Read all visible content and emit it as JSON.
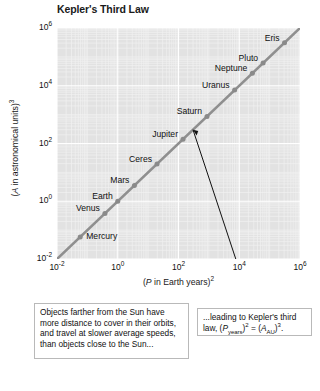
{
  "chart_data": {
    "type": "scatter",
    "title": "Kepler's Third Law",
    "xlabel": "(P in Earth years)²",
    "ylabel": "(A in astronomical units)³",
    "xlabel_parts": {
      "prefix": "(",
      "italic": "P",
      "mid": " in Earth years)",
      "exp": "2"
    },
    "ylabel_parts": {
      "prefix": "(",
      "italic": "A",
      "mid": " in astronomical units)",
      "exp": "3"
    },
    "xscale": "log",
    "yscale": "log",
    "xlim": [
      0.01,
      1000000
    ],
    "ylim": [
      0.01,
      1000000
    ],
    "grid": true,
    "legend": "none",
    "x_ticks": [
      {
        "value": 0.01,
        "label_base": "10",
        "label_exp": "-2"
      },
      {
        "value": 1,
        "label_base": "10",
        "label_exp": "0"
      },
      {
        "value": 100,
        "label_base": "10",
        "label_exp": "2"
      },
      {
        "value": 10000,
        "label_base": "10",
        "label_exp": "4"
      },
      {
        "value": 1000000,
        "label_base": "10",
        "label_exp": "6"
      }
    ],
    "y_ticks": [
      {
        "value": 0.01,
        "label_base": "10",
        "label_exp": "-2"
      },
      {
        "value": 1,
        "label_base": "10",
        "label_exp": "0"
      },
      {
        "value": 100,
        "label_base": "10",
        "label_exp": "2"
      },
      {
        "value": 10000,
        "label_base": "10",
        "label_exp": "4"
      },
      {
        "value": 1000000,
        "label_base": "10",
        "label_exp": "6"
      }
    ],
    "series": [
      {
        "name": "Solar system bodies",
        "point_color": "#8a8a8a",
        "line_color": "#8f8f8f",
        "points": [
          {
            "label": "Mercury",
            "x": 0.058,
            "y": 0.058,
            "label_pos": "right"
          },
          {
            "label": "Venus",
            "x": 0.378,
            "y": 0.378,
            "label_pos": "left"
          },
          {
            "label": "Earth",
            "x": 1.0,
            "y": 1.0,
            "label_pos": "left"
          },
          {
            "label": "Mars",
            "x": 3.538,
            "y": 3.538,
            "label_pos": "left"
          },
          {
            "label": "Ceres",
            "x": 19.6,
            "y": 19.6,
            "label_pos": "left"
          },
          {
            "label": "Jupiter",
            "x": 140.7,
            "y": 140.7,
            "label_pos": "left"
          },
          {
            "label": "Saturn",
            "x": 867.0,
            "y": 867.0,
            "label_pos": "left"
          },
          {
            "label": "Uranus",
            "x": 7056.0,
            "y": 7056.0,
            "label_pos": "left"
          },
          {
            "label": "Neptune",
            "x": 27040.0,
            "y": 27040.0,
            "label_pos": "left"
          },
          {
            "label": "Pluto",
            "x": 60940.0,
            "y": 60940.0,
            "label_pos": "left"
          },
          {
            "label": "Eris",
            "x": 310000.0,
            "y": 310000.0,
            "label_pos": "left"
          }
        ]
      }
    ],
    "trend_line": {
      "description": "y = x reference line through all points",
      "from": [
        0.01,
        0.01
      ],
      "to": [
        1000000,
        1000000
      ]
    },
    "leader_line": {
      "from_data": [
        300,
        300
      ],
      "to_px": [
        252,
        308
      ]
    }
  },
  "captions": {
    "left": "Objects farther from the Sun have more distance to cover in their orbits, and travel at slower average speeds, than objects close to the Sun...",
    "right_prefix": "...leading to Kepler's third law, (",
    "right_p": "P",
    "right_p_sub": "years",
    "right_mid": ")",
    "right_exp1": "2",
    "right_eq": " = (",
    "right_a": "A",
    "right_a_sub": "AU",
    "right_close": ")",
    "right_exp2": "3",
    "right_period": "."
  },
  "colors": {
    "plot_background": "#e2e2e2",
    "gridline_major": "#ffffff",
    "gridline_minor": "#f0f0f0",
    "point": "#8a8a8a",
    "trend": "#8f8f8f",
    "leader": "#111111",
    "text": "#111111"
  }
}
